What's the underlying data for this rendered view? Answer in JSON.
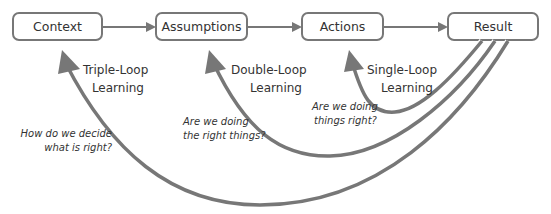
{
  "diagram": {
    "type": "flow",
    "colors": {
      "stroke": "#777777",
      "box_fill": "#ffffff",
      "text": "#333333"
    },
    "nodes": [
      {
        "id": "context",
        "label": "Context"
      },
      {
        "id": "assumptions",
        "label": "Assumptions"
      },
      {
        "id": "actions",
        "label": "Actions"
      },
      {
        "id": "result",
        "label": "Result"
      }
    ],
    "edges": [
      {
        "from": "context",
        "to": "assumptions"
      },
      {
        "from": "assumptions",
        "to": "actions"
      },
      {
        "from": "actions",
        "to": "result"
      }
    ],
    "loops": [
      {
        "id": "single",
        "from": "result",
        "to": "actions",
        "label_line1": "Single-Loop",
        "label_line2": "Learning",
        "question_line1": "Are we doing",
        "question_line2": "things right?"
      },
      {
        "id": "double",
        "from": "result",
        "to": "assumptions",
        "label_line1": "Double-Loop",
        "label_line2": "Learning",
        "question_line1": "Are we doing",
        "question_line2": "the right things?"
      },
      {
        "id": "triple",
        "from": "result",
        "to": "context",
        "label_line1": "Triple-Loop",
        "label_line2": "Learning",
        "question_line1": "How do we decide",
        "question_line2": "what is right?"
      }
    ]
  }
}
